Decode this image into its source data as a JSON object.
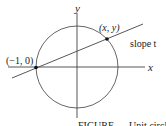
{
  "figure": {
    "axes": {
      "x_label": "x",
      "y_label": "y"
    },
    "points": [
      {
        "label": "(−1, 0)"
      },
      {
        "label": "(x, y)"
      }
    ],
    "line": {
      "label": "slope t"
    },
    "caption_partial": "FIGURE … Unit circle"
  },
  "colors": {
    "stroke": "#333333",
    "background": "#ffffff"
  }
}
